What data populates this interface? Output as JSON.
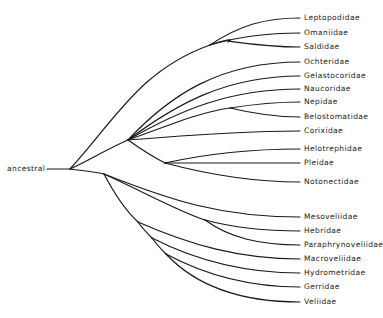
{
  "root": {
    "label": "ancestral",
    "x": 7,
    "y": 169
  },
  "taxa": [
    {
      "name": "Leptopodidae",
      "y": 18
    },
    {
      "name": "Omaniidae",
      "y": 33
    },
    {
      "name": "Saldidae",
      "y": 47
    },
    {
      "name": "Ochteridae",
      "y": 62
    },
    {
      "name": "Gelastocoridae",
      "y": 76
    },
    {
      "name": "Naucoridae",
      "y": 89
    },
    {
      "name": "Nepidae",
      "y": 102
    },
    {
      "name": "Belostomatidae",
      "y": 117
    },
    {
      "name": "Corixidae",
      "y": 131
    },
    {
      "name": "Helotrephidae",
      "y": 149
    },
    {
      "name": "Pleidae",
      "y": 163
    },
    {
      "name": "Notonectidae",
      "y": 182
    },
    {
      "name": "Mesoveliidae",
      "y": 217
    },
    {
      "name": "Hebridae",
      "y": 231
    },
    {
      "name": "Paraphrynoveliidae",
      "y": 245
    },
    {
      "name": "Macroveliidae",
      "y": 259
    },
    {
      "name": "Hydrometridae",
      "y": 273
    },
    {
      "name": "Gerridae",
      "y": 287
    },
    {
      "name": "Veliidae",
      "y": 302
    }
  ],
  "tip_x": 300,
  "label_x": 304,
  "line_color": "#1a1a1a"
}
